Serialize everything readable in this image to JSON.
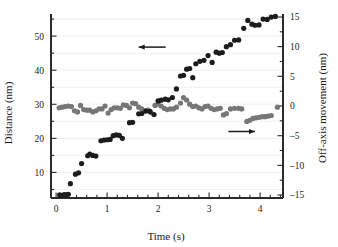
{
  "chart_data": {
    "type": "scatter",
    "title": "",
    "xlabel": "Time (s)",
    "ylabel": "Distance (nm)",
    "y2label": "Off-axis movement (nm)",
    "xlim": [
      -0.1,
      4.45
    ],
    "ylim": [
      2.5,
      56.5
    ],
    "y2lim": [
      -15.5,
      15.5
    ],
    "xticks": [
      0,
      1,
      2,
      3,
      4
    ],
    "xticklabels": [
      "0",
      "1",
      "2",
      "3",
      "4"
    ],
    "xminortick_step": 0.2,
    "yticks": [
      10,
      20,
      30,
      40,
      50
    ],
    "yticklabels": [
      "10",
      "20",
      "30",
      "40",
      "50"
    ],
    "yminortick_step": 5,
    "y2ticks": [
      -15,
      -10,
      -5,
      0,
      5,
      10,
      15
    ],
    "y2ticklabels": [
      "–15",
      "–10",
      "–5",
      "0",
      "5",
      "10",
      "15"
    ],
    "grid": true,
    "grid_axis": "y",
    "grid_color": "#f0f0f0",
    "legend": "none",
    "annotations": [
      {
        "name": "left-arrow",
        "text": "",
        "direction": "left",
        "x_start": 2.15,
        "x_end": 1.62,
        "y": 46.8,
        "axis": "left"
      },
      {
        "name": "right-arrow",
        "text": "",
        "direction": "right",
        "x_start": 3.38,
        "x_end": 3.9,
        "y": -4.3,
        "axis": "right"
      }
    ],
    "series": [
      {
        "name": "Distance",
        "axis": "left",
        "color": "#1c1c1c",
        "marker": "circle",
        "marker_size": 5.2,
        "points": [
          [
            0.07,
            3.4
          ],
          [
            0.12,
            3.3
          ],
          [
            0.16,
            3.5
          ],
          [
            0.2,
            3.4
          ],
          [
            0.24,
            3.6
          ],
          [
            0.28,
            6.7
          ],
          [
            0.38,
            9.5
          ],
          [
            0.44,
            9.9
          ],
          [
            0.5,
            12.6
          ],
          [
            0.62,
            14.9
          ],
          [
            0.66,
            15.4
          ],
          [
            0.72,
            15.0
          ],
          [
            0.78,
            14.8
          ],
          [
            0.88,
            19.3
          ],
          [
            0.94,
            19.5
          ],
          [
            1.0,
            19.6
          ],
          [
            1.06,
            19.7
          ],
          [
            1.12,
            20.8
          ],
          [
            1.18,
            21.0
          ],
          [
            1.24,
            20.9
          ],
          [
            1.3,
            20.0
          ],
          [
            1.44,
            24.6
          ],
          [
            1.5,
            24.7
          ],
          [
            1.62,
            27.2
          ],
          [
            1.68,
            27.3
          ],
          [
            1.76,
            28.0
          ],
          [
            1.84,
            27.9
          ],
          [
            1.92,
            27.0
          ],
          [
            2.0,
            31.0
          ],
          [
            2.06,
            31.2
          ],
          [
            2.14,
            31.5
          ],
          [
            2.2,
            31.3
          ],
          [
            2.28,
            32.0
          ],
          [
            2.36,
            34.5
          ],
          [
            2.44,
            38.3
          ],
          [
            2.5,
            38.5
          ],
          [
            2.56,
            40.3
          ],
          [
            2.62,
            40.5
          ],
          [
            2.68,
            37.8
          ],
          [
            2.74,
            41.9
          ],
          [
            2.82,
            42.6
          ],
          [
            2.9,
            42.9
          ],
          [
            2.98,
            44.3
          ],
          [
            3.06,
            42.3
          ],
          [
            3.14,
            45.3
          ],
          [
            3.2,
            45.0
          ],
          [
            3.26,
            45.2
          ],
          [
            3.34,
            46.9
          ],
          [
            3.42,
            47.5
          ],
          [
            3.5,
            48.8
          ],
          [
            3.58,
            48.9
          ],
          [
            3.68,
            52.3
          ],
          [
            3.76,
            54.6
          ],
          [
            3.84,
            53.5
          ],
          [
            3.9,
            53.2
          ],
          [
            3.98,
            53.3
          ],
          [
            4.06,
            55.0
          ],
          [
            4.14,
            54.9
          ],
          [
            4.22,
            55.6
          ],
          [
            4.3,
            55.8
          ]
        ]
      },
      {
        "name": "Off-axis movement",
        "axis": "right",
        "color": "#767676",
        "marker": "circle",
        "marker_size": 5.2,
        "points": [
          [
            0.06,
            -0.3
          ],
          [
            0.12,
            -0.2
          ],
          [
            0.18,
            -0.1
          ],
          [
            0.24,
            0.0
          ],
          [
            0.3,
            -0.1
          ],
          [
            0.36,
            -0.8
          ],
          [
            0.42,
            -1.0
          ],
          [
            0.48,
            0.1
          ],
          [
            0.54,
            -0.6
          ],
          [
            0.6,
            -0.7
          ],
          [
            0.66,
            -0.7
          ],
          [
            0.72,
            -1.0
          ],
          [
            0.78,
            -0.8
          ],
          [
            0.84,
            -0.5
          ],
          [
            0.9,
            -0.5
          ],
          [
            0.96,
            0.0
          ],
          [
            1.02,
            -1.2
          ],
          [
            1.08,
            -0.6
          ],
          [
            1.14,
            -0.3
          ],
          [
            1.2,
            -0.3
          ],
          [
            1.26,
            -0.4
          ],
          [
            1.32,
            0.2
          ],
          [
            1.38,
            0.1
          ],
          [
            1.44,
            -0.3
          ],
          [
            1.5,
            0.5
          ],
          [
            1.56,
            0.4
          ],
          [
            1.62,
            -0.2
          ],
          [
            1.68,
            -0.5
          ],
          [
            1.74,
            -0.8
          ],
          [
            1.8,
            -0.7
          ],
          [
            1.86,
            -1.1
          ],
          [
            1.94,
            0.1
          ],
          [
            2.0,
            0.3
          ],
          [
            2.06,
            0.0
          ],
          [
            2.12,
            -0.4
          ],
          [
            2.18,
            -0.6
          ],
          [
            2.24,
            -0.5
          ],
          [
            2.3,
            -0.5
          ],
          [
            2.36,
            -0.2
          ],
          [
            2.44,
            0.5
          ],
          [
            2.5,
            1.4
          ],
          [
            2.56,
            1.0
          ],
          [
            2.62,
            0.3
          ],
          [
            2.68,
            -0.1
          ],
          [
            2.74,
            0.0
          ],
          [
            2.8,
            -0.3
          ],
          [
            2.86,
            -0.5
          ],
          [
            2.92,
            -0.1
          ],
          [
            2.98,
            0.0
          ],
          [
            3.04,
            -0.4
          ],
          [
            3.1,
            -0.6
          ],
          [
            3.16,
            -0.5
          ],
          [
            3.22,
            -0.4
          ],
          [
            3.28,
            -1.5
          ],
          [
            3.34,
            -1.3
          ],
          [
            3.42,
            -0.5
          ],
          [
            3.5,
            -0.4
          ],
          [
            3.58,
            -0.4
          ],
          [
            3.64,
            -0.5
          ],
          [
            3.74,
            -2.6
          ],
          [
            3.8,
            -2.4
          ],
          [
            3.86,
            -2.1
          ],
          [
            3.92,
            -2.0
          ],
          [
            3.98,
            -1.9
          ],
          [
            4.04,
            -1.8
          ],
          [
            4.1,
            -1.8
          ],
          [
            4.16,
            -1.7
          ],
          [
            4.22,
            -1.6
          ],
          [
            4.34,
            -0.2
          ]
        ]
      }
    ]
  }
}
